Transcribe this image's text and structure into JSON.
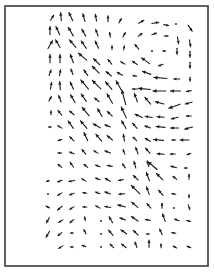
{
  "chart_data": {
    "type": "quiver",
    "title": "",
    "xlabel": "",
    "ylabel": "",
    "grid": false,
    "legend": null,
    "frame": {
      "x": 5,
      "y": 6,
      "width": 203,
      "height": 260,
      "color": "#3a3a3a"
    },
    "arrow_color": "#1a1a1a",
    "note": "Vector field; each vector = [x_px, y_px, angle_deg (0=right, 90=up, screen), length_px]. Dominant flow points up-left (NW) toward upper-left region; strong leftward flow on right side mid-height; small/zero vectors in bottom-left.",
    "vectors": [
      [
        52,
        18,
        60,
        6
      ],
      [
        61,
        17,
        95,
        8
      ],
      [
        71,
        17,
        115,
        9
      ],
      [
        84,
        18,
        105,
        8
      ],
      [
        96,
        18,
        100,
        7
      ],
      [
        108,
        19,
        90,
        6
      ],
      [
        120,
        21,
        60,
        5
      ],
      [
        141,
        22,
        30,
        6
      ],
      [
        155,
        23,
        10,
        7
      ],
      [
        166,
        25,
        -10,
        5
      ],
      [
        176,
        24,
        0,
        2
      ],
      [
        190,
        28,
        -55,
        7
      ],
      [
        50,
        31,
        90,
        8
      ],
      [
        58,
        31,
        115,
        9
      ],
      [
        71,
        32,
        120,
        10
      ],
      [
        84,
        33,
        120,
        8
      ],
      [
        97,
        33,
        110,
        7
      ],
      [
        110,
        35,
        100,
        5
      ],
      [
        124,
        35,
        60,
        5
      ],
      [
        140,
        35,
        40,
        5
      ],
      [
        154,
        34,
        20,
        5
      ],
      [
        166,
        36,
        0,
        4
      ],
      [
        178,
        40,
        -80,
        7
      ],
      [
        190,
        43,
        -80,
        7
      ],
      [
        50,
        45,
        60,
        9
      ],
      [
        58,
        44,
        120,
        9
      ],
      [
        73,
        44,
        130,
        10
      ],
      [
        84,
        45,
        125,
        9
      ],
      [
        97,
        45,
        115,
        8
      ],
      [
        112,
        48,
        90,
        4
      ],
      [
        124,
        48,
        80,
        4
      ],
      [
        137,
        47,
        130,
        6
      ],
      [
        152,
        51,
        0,
        1
      ],
      [
        164,
        51,
        0,
        3
      ],
      [
        177,
        51,
        -90,
        6
      ],
      [
        190,
        54,
        -90,
        6
      ],
      [
        50,
        59,
        90,
        8
      ],
      [
        60,
        59,
        90,
        8
      ],
      [
        72,
        59,
        110,
        9
      ],
      [
        83,
        57,
        140,
        11
      ],
      [
        97,
        62,
        135,
        9
      ],
      [
        110,
        62,
        130,
        6
      ],
      [
        123,
        63,
        150,
        5
      ],
      [
        135,
        63,
        145,
        6
      ],
      [
        146,
        61,
        145,
        10
      ],
      [
        161,
        65,
        200,
        5
      ],
      [
        190,
        65,
        -90,
        6
      ],
      [
        50,
        73,
        70,
        6
      ],
      [
        60,
        73,
        80,
        6
      ],
      [
        72,
        72,
        110,
        6
      ],
      [
        86,
        73,
        125,
        7
      ],
      [
        96,
        70,
        135,
        10
      ],
      [
        109,
        74,
        140,
        7
      ],
      [
        120,
        74,
        150,
        6
      ],
      [
        135,
        76,
        170,
        4
      ],
      [
        147,
        73,
        160,
        9
      ],
      [
        161,
        78,
        175,
        13
      ],
      [
        177,
        79,
        180,
        6
      ],
      [
        190,
        79,
        -90,
        4
      ],
      [
        51,
        86,
        80,
        7
      ],
      [
        60,
        86,
        95,
        8
      ],
      [
        72,
        86,
        115,
        8
      ],
      [
        85,
        85,
        130,
        12
      ],
      [
        97,
        85,
        135,
        12
      ],
      [
        109,
        86,
        130,
        10
      ],
      [
        119,
        86,
        120,
        11
      ],
      [
        135,
        89,
        180,
        5
      ],
      [
        145,
        89,
        175,
        12
      ],
      [
        160,
        91,
        180,
        13
      ],
      [
        176,
        91,
        180,
        10
      ],
      [
        189,
        91,
        190,
        5
      ],
      [
        50,
        99,
        60,
        5
      ],
      [
        60,
        99,
        110,
        7
      ],
      [
        73,
        99,
        120,
        9
      ],
      [
        84,
        98,
        125,
        9
      ],
      [
        97,
        100,
        140,
        6
      ],
      [
        110,
        99,
        120,
        11
      ],
      [
        124,
        98,
        105,
        15
      ],
      [
        136,
        98,
        110,
        9
      ],
      [
        148,
        101,
        130,
        9
      ],
      [
        160,
        103,
        165,
        9
      ],
      [
        175,
        106,
        200,
        12
      ],
      [
        189,
        103,
        195,
        7
      ],
      [
        51,
        113,
        90,
        4
      ],
      [
        60,
        113,
        130,
        6
      ],
      [
        72,
        113,
        140,
        6
      ],
      [
        86,
        112,
        130,
        11
      ],
      [
        100,
        113,
        120,
        9
      ],
      [
        110,
        114,
        135,
        7
      ],
      [
        124,
        113,
        115,
        12
      ],
      [
        139,
        116,
        155,
        8
      ],
      [
        149,
        117,
        170,
        7
      ],
      [
        161,
        117,
        175,
        7
      ],
      [
        175,
        118,
        195,
        7
      ],
      [
        189,
        116,
        180,
        5
      ],
      [
        50,
        127,
        180,
        3
      ],
      [
        60,
        127,
        150,
        5
      ],
      [
        71,
        125,
        125,
        9
      ],
      [
        84,
        125,
        130,
        10
      ],
      [
        97,
        126,
        150,
        8
      ],
      [
        108,
        126,
        160,
        6
      ],
      [
        124,
        125,
        120,
        9
      ],
      [
        135,
        126,
        130,
        7
      ],
      [
        148,
        127,
        160,
        6
      ],
      [
        161,
        127,
        175,
        9
      ],
      [
        175,
        128,
        180,
        8
      ],
      [
        189,
        128,
        195,
        8
      ],
      [
        60,
        140,
        200,
        4
      ],
      [
        72,
        139,
        135,
        6
      ],
      [
        86,
        137,
        115,
        9
      ],
      [
        99,
        138,
        130,
        9
      ],
      [
        110,
        138,
        140,
        7
      ],
      [
        124,
        138,
        100,
        7
      ],
      [
        135,
        139,
        135,
        5
      ],
      [
        148,
        140,
        150,
        6
      ],
      [
        159,
        140,
        175,
        10
      ],
      [
        174,
        140,
        180,
        4
      ],
      [
        185,
        140,
        180,
        9
      ],
      [
        60,
        153,
        180,
        4
      ],
      [
        72,
        153,
        160,
        5
      ],
      [
        84,
        152,
        130,
        6
      ],
      [
        96,
        152,
        150,
        5
      ],
      [
        108,
        152,
        160,
        6
      ],
      [
        124,
        152,
        110,
        5
      ],
      [
        137,
        151,
        110,
        7
      ],
      [
        148,
        151,
        130,
        7
      ],
      [
        161,
        154,
        175,
        7
      ],
      [
        173,
        154,
        180,
        5
      ],
      [
        189,
        154,
        200,
        4
      ],
      [
        60,
        166,
        140,
        5
      ],
      [
        72,
        165,
        125,
        6
      ],
      [
        86,
        166,
        140,
        5
      ],
      [
        98,
        166,
        160,
        5
      ],
      [
        110,
        166,
        170,
        5
      ],
      [
        124,
        166,
        125,
        5
      ],
      [
        135,
        165,
        105,
        7
      ],
      [
        148,
        164,
        105,
        6
      ],
      [
        153,
        166,
        140,
        12
      ],
      [
        174,
        167,
        165,
        6
      ],
      [
        186,
        168,
        180,
        3
      ],
      [
        48,
        181,
        200,
        3
      ],
      [
        60,
        181,
        200,
        5
      ],
      [
        72,
        181,
        190,
        6
      ],
      [
        84,
        180,
        150,
        5
      ],
      [
        98,
        179,
        160,
        5
      ],
      [
        108,
        180,
        150,
        6
      ],
      [
        121,
        180,
        190,
        5
      ],
      [
        136,
        178,
        135,
        7
      ],
      [
        148,
        177,
        110,
        9
      ],
      [
        160,
        177,
        135,
        9
      ],
      [
        175,
        178,
        140,
        5
      ],
      [
        189,
        177,
        90,
        5
      ],
      [
        48,
        194,
        0,
        2
      ],
      [
        60,
        194,
        210,
        5
      ],
      [
        72,
        194,
        200,
        5
      ],
      [
        85,
        193,
        170,
        4
      ],
      [
        98,
        193,
        160,
        5
      ],
      [
        108,
        193,
        160,
        6
      ],
      [
        122,
        194,
        185,
        6
      ],
      [
        136,
        190,
        135,
        12
      ],
      [
        148,
        191,
        110,
        8
      ],
      [
        161,
        193,
        130,
        7
      ],
      [
        174,
        194,
        170,
        4
      ],
      [
        189,
        196,
        -90,
        3
      ],
      [
        48,
        207,
        150,
        4
      ],
      [
        60,
        208,
        220,
        6
      ],
      [
        72,
        208,
        210,
        5
      ],
      [
        85,
        207,
        180,
        4
      ],
      [
        98,
        207,
        150,
        5
      ],
      [
        108,
        207,
        170,
        6
      ],
      [
        122,
        206,
        165,
        8
      ],
      [
        135,
        205,
        140,
        8
      ],
      [
        149,
        206,
        130,
        6
      ],
      [
        162,
        206,
        90,
        5
      ],
      [
        174,
        208,
        0,
        2
      ],
      [
        189,
        207,
        -70,
        5
      ],
      [
        48,
        220,
        240,
        6
      ],
      [
        61,
        221,
        210,
        5
      ],
      [
        72,
        221,
        220,
        5
      ],
      [
        85,
        219,
        100,
        4
      ],
      [
        101,
        221,
        0,
        1
      ],
      [
        111,
        220,
        120,
        7
      ],
      [
        123,
        219,
        160,
        6
      ],
      [
        135,
        219,
        145,
        8
      ],
      [
        148,
        220,
        170,
        5
      ],
      [
        164,
        218,
        110,
        8
      ],
      [
        177,
        220,
        160,
        5
      ],
      [
        189,
        221,
        165,
        4
      ],
      [
        48,
        234,
        240,
        7
      ],
      [
        60,
        234,
        220,
        5
      ],
      [
        72,
        233,
        180,
        3
      ],
      [
        85,
        232,
        115,
        5
      ],
      [
        101,
        234,
        0,
        1
      ],
      [
        111,
        233,
        130,
        7
      ],
      [
        124,
        232,
        145,
        7
      ],
      [
        136,
        233,
        135,
        7
      ],
      [
        148,
        234,
        180,
        3
      ],
      [
        161,
        232,
        115,
        6
      ],
      [
        174,
        233,
        170,
        4
      ],
      [
        61,
        247,
        210,
        5
      ],
      [
        72,
        247,
        180,
        3
      ],
      [
        84,
        246,
        160,
        4
      ],
      [
        101,
        247,
        0,
        1
      ],
      [
        112,
        246,
        135,
        5
      ],
      [
        124,
        246,
        140,
        6
      ],
      [
        136,
        245,
        110,
        6
      ],
      [
        149,
        244,
        90,
        7
      ],
      [
        161,
        246,
        90,
        4
      ],
      [
        175,
        247,
        150,
        4
      ],
      [
        189,
        247,
        160,
        4
      ]
    ]
  }
}
